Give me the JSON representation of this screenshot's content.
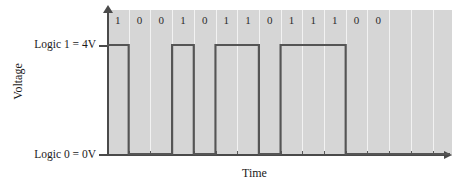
{
  "chart_data": {
    "type": "line",
    "title": "",
    "xlabel": "Time",
    "ylabel": "Voltage",
    "y_tick_labels": [
      "Logic 1 = 4V",
      "Logic 0 = 0V"
    ],
    "y_values": [
      4,
      0
    ],
    "y_unit": "V",
    "grid": true,
    "legend": "none",
    "waveform_style": "square-digital",
    "bit_count": 13,
    "categories": [
      "1",
      "2",
      "3",
      "4",
      "5",
      "6",
      "7",
      "8",
      "9",
      "10",
      "11",
      "12",
      "13"
    ],
    "bits": [
      1,
      0,
      0,
      1,
      0,
      1,
      1,
      0,
      1,
      1,
      1,
      0,
      0
    ],
    "bit_labels": [
      "1",
      "0",
      "0",
      "1",
      "0",
      "1",
      "1",
      "0",
      "1",
      "1",
      "1",
      "0",
      "0"
    ],
    "values": [
      4,
      0,
      0,
      4,
      0,
      4,
      4,
      0,
      4,
      4,
      4,
      0,
      0
    ],
    "ylim": [
      0,
      4
    ]
  },
  "axes": {
    "y_title": "Voltage",
    "x_title": "Time",
    "high_label": "Logic 1 = 4V",
    "low_label": "Logic 0 = 0V"
  },
  "colors": {
    "plot_background": "#d6d6d6",
    "gridline": "#f2f2f2",
    "axis": "#4a4a4a",
    "waveform": "#555555",
    "text": "#1a1a1a",
    "page_background": "#ffffff"
  }
}
